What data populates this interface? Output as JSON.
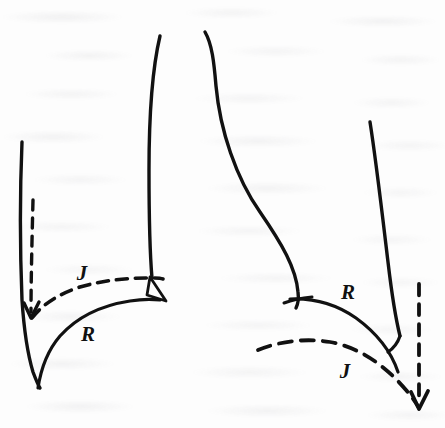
{
  "figure": {
    "kind": "line-drawing",
    "medium": "scanned book page",
    "background_color": "#fdfdfd",
    "ink_color": "#111111",
    "width": 445,
    "height": 428
  },
  "labels": {
    "left_dashed": "J",
    "left_solid": "R",
    "right_solid": "R",
    "right_dashed": "J"
  },
  "strokes": {
    "left_chest_wall": {
      "name": "left-chest-wall",
      "style": "solid",
      "d": "M 22,142 C 20,190 20,250 22,300 C 24,330 27,352 33,372 C 36,380 38,385 40,388"
    },
    "left_solid_diaphragm": {
      "name": "left-solid-diaphragm",
      "style": "solid",
      "label": "R",
      "d": "M 38,388 C 41,368 48,350 60,336 C 78,316 104,305 130,301 C 142,299 152,299 160,300"
    },
    "left_dashed_diaphragm": {
      "name": "left-dashed-diaphragm",
      "style": "dashed",
      "label": "J",
      "d": "M 32,318 C 42,305 58,294 80,287 C 104,280 128,278 148,278 C 155,278 160,278 163,279"
    },
    "left_displacement_arrow": {
      "name": "left-displacement-arrow",
      "style": "dashed",
      "arrow": "down",
      "d": "M 33,200 C 32,240 31,280 31,312"
    },
    "mediastinum_left_border": {
      "name": "mediastinum-left-border",
      "style": "solid",
      "d": "M 160,36 C 152,70 149,120 149,170 C 149,215 150,255 152,278"
    },
    "mediastinum_right_border": {
      "name": "mediastinum-right-border",
      "style": "solid",
      "d": "M 205,32 C 212,44 214,62 216,86 C 220,130 236,178 260,212 C 282,244 296,268 298,292 C 299,300 298,304 296,308"
    },
    "left_cardiophrenic_wedge": {
      "name": "left-cardiophrenic-wedge",
      "style": "solid",
      "d": "M 150,277 L 166,301 L 147,295 Z"
    },
    "right_cardiophrenic_crossing": {
      "name": "right-cardiophrenic-crossing",
      "style": "solid",
      "d": "M 284,303 C 292,300 302,298 312,297"
    },
    "right_solid_diaphragm": {
      "name": "right-solid-diaphragm",
      "style": "solid",
      "label": "R",
      "d": "M 290,299 C 312,298 336,304 356,318 C 378,334 392,354 398,372"
    },
    "right_dashed_diaphragm": {
      "name": "right-dashed-diaphragm",
      "style": "dashed",
      "label": "J",
      "d": "M 258,350 C 280,341 306,338 330,342 C 358,347 384,364 406,390 C 412,397 416,403 419,408"
    },
    "right_chest_wall": {
      "name": "right-chest-wall",
      "style": "solid",
      "d": "M 370,122 C 376,160 382,212 388,262 C 392,296 396,320 400,336"
    },
    "right_displacement_arrow": {
      "name": "right-displacement-arrow",
      "style": "dashed",
      "arrow": "down",
      "d": "M 419,284 C 419,330 419,370 419,404"
    }
  },
  "label_positions": {
    "left_dashed": {
      "x": 82,
      "y": 280
    },
    "left_solid": {
      "x": 88,
      "y": 340
    },
    "right_solid": {
      "x": 340,
      "y": 298
    },
    "right_dashed": {
      "x": 338,
      "y": 377
    }
  }
}
